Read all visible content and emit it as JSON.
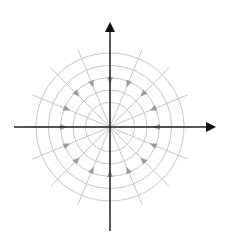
{
  "diagram": {
    "title": "",
    "field_type": "sink",
    "radial_direction_count": 16,
    "concentric_circle_count": 5,
    "arrow_direction": "inward",
    "axes": {
      "x": {
        "label": "",
        "arrow": "positive"
      },
      "y": {
        "label": "",
        "arrow": "positive"
      }
    },
    "colors": {
      "axis": "#222222",
      "axis_head": "#111111",
      "grid": "#c9c9c9",
      "field_arrow": "#9a9a9a",
      "background": "#ffffff"
    }
  }
}
